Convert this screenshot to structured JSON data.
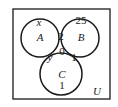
{
  "diagram": {
    "type": "venn-3-set",
    "universe_label": "U",
    "sets": [
      {
        "name": "A",
        "cx": 40,
        "cy": 38,
        "r": 19
      },
      {
        "name": "B",
        "cx": 80,
        "cy": 38,
        "r": 19
      },
      {
        "name": "C",
        "cx": 61,
        "cy": 74,
        "r": 21
      }
    ],
    "regions": {
      "only_A": "x",
      "only_B": "25",
      "A_and_B_only": "2",
      "A_and_B_and_C": "0",
      "A_and_C_only": "y",
      "B_and_C_only": "1",
      "only_C": "1"
    },
    "colors": {
      "stroke": "#1a1a1a",
      "background": "#ffffff"
    }
  }
}
